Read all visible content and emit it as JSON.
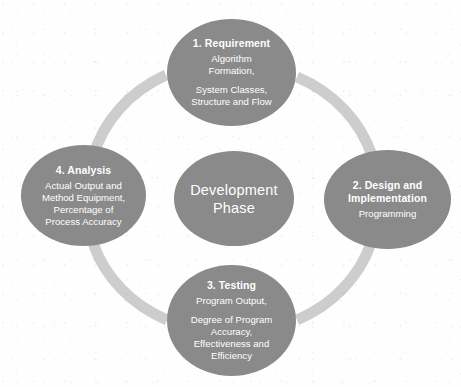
{
  "diagram": {
    "kind": "cycle-diagram",
    "colors": {
      "node_fill": "#8a8a8a",
      "ring": "#cdcdcd",
      "text": "#ffffff",
      "background": "#ffffff"
    },
    "center": {
      "label": "Development\nPhase"
    },
    "nodes": [
      {
        "id": "requirement",
        "position": "top",
        "title": "1. Requirement",
        "lines": [
          "Algorithm\nFormation,",
          "System Classes,\nStructure and Flow"
        ]
      },
      {
        "id": "design",
        "position": "right",
        "title": "2. Design and\nImplementation",
        "lines": [
          "Programming"
        ]
      },
      {
        "id": "testing",
        "position": "bottom",
        "title": "3. Testing",
        "lines": [
          "Program Output,",
          "Degree of Program\nAccuracy,\nEffectiveness and\nEfficiency"
        ]
      },
      {
        "id": "analysis",
        "position": "left",
        "title": "4. Analysis",
        "lines": [
          "Actual Output and\nMethod Equipment,\nPercentage of\nProcess Accuracy"
        ]
      }
    ]
  }
}
